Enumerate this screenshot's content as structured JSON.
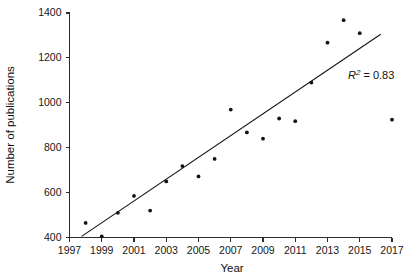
{
  "chart_data": {
    "type": "scatter",
    "title": "",
    "xlabel": "Year",
    "ylabel": "Number of publications",
    "xlim": [
      1997,
      2017
    ],
    "ylim": [
      400,
      1400
    ],
    "xticks": [
      1997,
      1999,
      2001,
      2003,
      2005,
      2007,
      2009,
      2011,
      2013,
      2015,
      2017
    ],
    "yticks": [
      400,
      600,
      800,
      1000,
      1200,
      1400
    ],
    "grid": false,
    "legend": null,
    "x": [
      1998,
      1999,
      2000,
      2001,
      2002,
      2003,
      2004,
      2005,
      2006,
      2007,
      2008,
      2009,
      2010,
      2011,
      2012,
      2013,
      2014,
      2015,
      2017
    ],
    "y": [
      465,
      405,
      510,
      585,
      520,
      650,
      718,
      672,
      750,
      970,
      868,
      840,
      930,
      918,
      1090,
      1268,
      1368,
      1310,
      925
    ],
    "series": [
      {
        "name": "Number of publications",
        "points": [
          {
            "year": 1998,
            "value": 465
          },
          {
            "year": 1999,
            "value": 405
          },
          {
            "year": 2000,
            "value": 510
          },
          {
            "year": 2001,
            "value": 585
          },
          {
            "year": 2002,
            "value": 520
          },
          {
            "year": 2003,
            "value": 650
          },
          {
            "year": 2004,
            "value": 718
          },
          {
            "year": 2005,
            "value": 672
          },
          {
            "year": 2006,
            "value": 750
          },
          {
            "year": 2007,
            "value": 970
          },
          {
            "year": 2008,
            "value": 868
          },
          {
            "year": 2009,
            "value": 840
          },
          {
            "year": 2010,
            "value": 930
          },
          {
            "year": 2011,
            "value": 918
          },
          {
            "year": 2012,
            "value": 1090
          },
          {
            "year": 2013,
            "value": 1268
          },
          {
            "year": 2014,
            "value": 1368
          },
          {
            "year": 2015,
            "value": 1310
          },
          {
            "year": 2017,
            "value": 925
          }
        ]
      }
    ],
    "trendline": {
      "type": "linear",
      "x_start": 1997.75,
      "y_start": 405,
      "x_end": 2016.3,
      "y_end": 1305
    },
    "annotations": [
      {
        "name": "r-squared",
        "r_symbol": "R",
        "superscript": "2",
        "equals": " = ",
        "value": "0.83",
        "text": "R2 = 0.83",
        "x": 2014.2,
        "y": 1128
      }
    ]
  },
  "axes": {
    "x_title": "Year",
    "y_title": "Number of publications",
    "x_tick_labels": [
      "1997",
      "1999",
      "2001",
      "2003",
      "2005",
      "2007",
      "2009",
      "2011",
      "2013",
      "2015",
      "2017"
    ],
    "y_tick_labels": [
      "400",
      "600",
      "800",
      "1000",
      "1200",
      "1400"
    ]
  },
  "style": {
    "marker_color": "#141414",
    "line_color": "#141414",
    "axis_color": "#2b2b2b",
    "background": "#ffffff"
  }
}
